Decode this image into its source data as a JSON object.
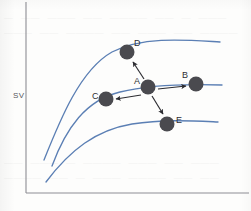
{
  "figure": {
    "background_color": "#fdfdfc",
    "axis_color": "#8d8d93",
    "curve_color": "#5b7fb4",
    "marker_color": "#4a4a4f",
    "arrow_color": "#2b2b30",
    "y_axis_label": "SV",
    "x_axis_label": ""
  },
  "ghost_text": {
    "line1": "— —— ——— —— ———— —— — ——— ——",
    "line2": "——— ——  ———— —— ——— —— ————",
    "line3": "—— ——— — ———— ——— —— ———",
    "line4": "———— —— — ——— ———— —— ——"
  },
  "chart_data": {
    "type": "line",
    "title": "",
    "xlabel": "",
    "ylabel": "SV",
    "grid": false,
    "legend": "none",
    "xlim": [
      0,
      251
    ],
    "ylim": [
      0,
      211
    ],
    "axes": {
      "y_axis_x": 26,
      "y_axis_top": 2,
      "y_axis_bottom": 193,
      "x_axis_y": 193,
      "x_axis_left": 26,
      "x_axis_right": 249
    },
    "series": [
      {
        "name": "upper-curve",
        "color": "#5b7fb4",
        "path": "M 44,160 C 60,120 80,70 112,52 C 144,36 186,40 220,42"
      },
      {
        "name": "middle-curve",
        "color": "#5b7fb4",
        "path": "M 52,166 C 66,128 86,100 120,92 C 152,84 190,84 222,85"
      },
      {
        "name": "lower-curve",
        "color": "#5b7fb4",
        "path": "M 46,182 C 70,150 96,130 132,124 C 164,119 196,121 218,122"
      }
    ],
    "points": [
      {
        "id": "A",
        "label": "A",
        "cx": 148,
        "cy": 87,
        "r": 7.5,
        "label_x": 134,
        "label_y": 76,
        "curve": "middle-curve"
      },
      {
        "id": "B",
        "label": "B",
        "cx": 196,
        "cy": 84,
        "r": 7.5,
        "label_x": 182,
        "label_y": 70,
        "curve": "middle-curve"
      },
      {
        "id": "C",
        "label": "C",
        "cx": 106,
        "cy": 99,
        "r": 7.5,
        "label_x": 92,
        "label_y": 91,
        "curve": "middle-curve"
      },
      {
        "id": "D",
        "label": "D",
        "cx": 127,
        "cy": 52,
        "r": 7.5,
        "label_x": 134,
        "label_y": 38,
        "curve": "upper-curve"
      },
      {
        "id": "E",
        "label": "E",
        "cx": 167,
        "cy": 124,
        "r": 7.5,
        "label_x": 176,
        "label_y": 115,
        "curve": "lower-curve"
      }
    ],
    "arrows": [
      {
        "id": "A-to-B",
        "from": "A",
        "to": "B",
        "x1": 158,
        "y1": 89,
        "x2": 186,
        "y2": 86
      },
      {
        "id": "A-to-C",
        "from": "A",
        "to": "C",
        "x1": 141,
        "y1": 95,
        "x2": 116,
        "y2": 99
      },
      {
        "id": "A-to-D",
        "from": "A",
        "to": "D",
        "x1": 144,
        "y1": 79,
        "x2": 133,
        "y2": 62
      },
      {
        "id": "A-to-E",
        "from": "A",
        "to": "E",
        "x1": 152,
        "y1": 96,
        "x2": 163,
        "y2": 114
      }
    ]
  }
}
